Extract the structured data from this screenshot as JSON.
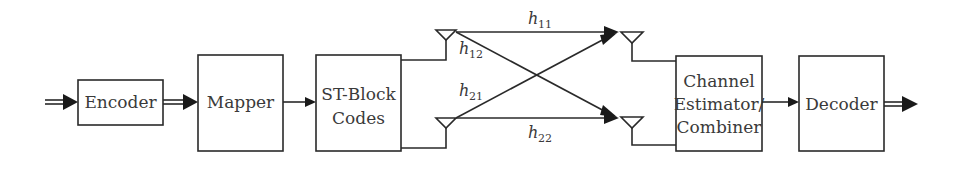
{
  "diagram": {
    "blocks": {
      "encoder": "Encoder",
      "mapper": "Mapper",
      "st_block_line1": "ST-Block",
      "st_block_line2": "Codes",
      "channel_est_line1": "Channel",
      "channel_est_line2": "Estimator/",
      "channel_est_line3": "Combiner",
      "decoder": "Decoder"
    },
    "channels": {
      "h11": {
        "base": "h",
        "sub": "11"
      },
      "h12": {
        "base": "h",
        "sub": "12"
      },
      "h21": {
        "base": "h",
        "sub": "21"
      },
      "h22": {
        "base": "h",
        "sub": "22"
      }
    },
    "colors": {
      "line": "#2a2a2a",
      "text": "#3a3a3a",
      "background": "#ffffff"
    }
  }
}
